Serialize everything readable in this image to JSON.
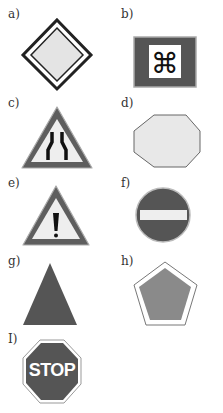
{
  "colors": {
    "dark": "#555555",
    "mid": "#8a8a8a",
    "light": "#e4e4e4",
    "outline": "#222222",
    "white": "#ffffff"
  },
  "signs": [
    {
      "label": "a)",
      "shape": "diamond",
      "description": "priority road diamond"
    },
    {
      "label": "b)",
      "shape": "rectangle",
      "description": "command symbol sign",
      "glyph": "⌘"
    },
    {
      "label": "c)",
      "shape": "triangle",
      "description": "road narrows warning"
    },
    {
      "label": "d)",
      "shape": "octagon",
      "description": "blank light octagon"
    },
    {
      "label": "e)",
      "shape": "triangle",
      "description": "exclamation warning",
      "glyph": "!"
    },
    {
      "label": "f)",
      "shape": "circle",
      "description": "no entry"
    },
    {
      "label": "g)",
      "shape": "triangle",
      "description": "solid dark triangle"
    },
    {
      "label": "h)",
      "shape": "pentagon",
      "description": "grey pentagon"
    },
    {
      "label": "I)",
      "shape": "octagon",
      "description": "stop sign",
      "text": "STOP"
    }
  ]
}
